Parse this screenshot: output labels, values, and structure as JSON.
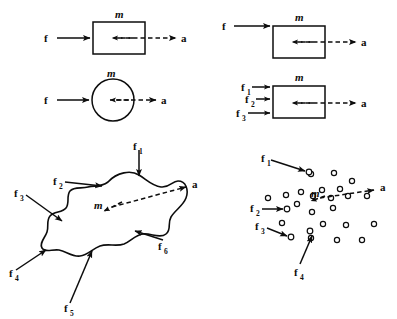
{
  "figure": {
    "background": "#ffffff",
    "ink": "#0d0d0d",
    "panels": [
      {
        "id": "panel-block-single-force",
        "position": "top-left",
        "shape": "rectangle",
        "mass_label": "m",
        "acceleration_label": "a",
        "forces": [
          {
            "label": "f",
            "subscript": ""
          }
        ],
        "description": "Rectangular block with one horizontal force f on the left and acceleration a to the right"
      },
      {
        "id": "panel-block-offset-force",
        "position": "top-right",
        "shape": "rectangle",
        "mass_label": "m",
        "acceleration_label": "a",
        "forces": [
          {
            "label": "f",
            "subscript": ""
          }
        ],
        "description": "Rectangular block with force f applied at the top-left corner and acceleration a to the right"
      },
      {
        "id": "panel-circle-single-force",
        "position": "middle-left",
        "shape": "circle",
        "mass_label": "m",
        "acceleration_label": "a",
        "forces": [
          {
            "label": "f",
            "subscript": ""
          }
        ],
        "description": "Circular body with one horizontal force f on the left and acceleration a to the right"
      },
      {
        "id": "panel-block-three-forces",
        "position": "middle-right",
        "shape": "rectangle",
        "mass_label": "m",
        "acceleration_label": "a",
        "forces": [
          {
            "label": "f",
            "subscript": "1"
          },
          {
            "label": "f",
            "subscript": "2"
          },
          {
            "label": "f",
            "subscript": "3"
          }
        ],
        "description": "Rectangular block with three parallel forces f1, f2, f3 on the left edge and acceleration a to the right"
      },
      {
        "id": "panel-irregular-body-six-forces",
        "position": "bottom-left",
        "shape": "irregular-blob",
        "mass_label": "m",
        "acceleration_label": "a",
        "forces": [
          {
            "label": "f",
            "subscript": "1"
          },
          {
            "label": "f",
            "subscript": "2"
          },
          {
            "label": "f",
            "subscript": "3"
          },
          {
            "label": "f",
            "subscript": "4"
          },
          {
            "label": "f",
            "subscript": "5"
          },
          {
            "label": "f",
            "subscript": "6"
          }
        ],
        "description": "Irregular rigid body with six forces f1 through f6 applied around its boundary and acceleration a of the center of mass"
      },
      {
        "id": "panel-particle-cloud-four-forces",
        "position": "bottom-right",
        "shape": "particle-cloud",
        "mass_label": "m",
        "acceleration_label": "a",
        "particle_count": 22,
        "forces": [
          {
            "label": "f",
            "subscript": "1"
          },
          {
            "label": "f",
            "subscript": "2"
          },
          {
            "label": "f",
            "subscript": "3"
          },
          {
            "label": "f",
            "subscript": "4"
          }
        ],
        "description": "Cloud of discrete particles with four external forces f1 through f4 applied to individual particles and acceleration a of the center of mass"
      }
    ],
    "labels": {
      "force": "f",
      "mass": "m",
      "acceleration": "a",
      "subscripts": [
        "1",
        "2",
        "3",
        "4",
        "5",
        "6"
      ]
    }
  }
}
